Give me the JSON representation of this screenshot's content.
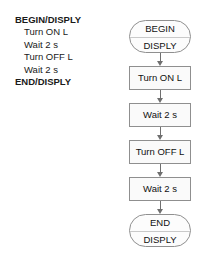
{
  "pseudocode": {
    "lines": [
      {
        "text": "BEGIN/DISPLY",
        "style": "keyword"
      },
      {
        "text": "Turn ON L",
        "style": "stmt"
      },
      {
        "text": "Wait 2 s",
        "style": "stmt"
      },
      {
        "text": "Turn OFF L",
        "style": "stmt"
      },
      {
        "text": "Wait 2 s",
        "style": "stmt"
      },
      {
        "text": "END/DISPLY",
        "style": "keyword"
      }
    ]
  },
  "flowchart": {
    "nodes": [
      {
        "type": "terminal",
        "line1": "BEGIN",
        "line2": "DISPLY"
      },
      {
        "type": "process",
        "label": "Turn ON L"
      },
      {
        "type": "process",
        "label": "Wait 2 s"
      },
      {
        "type": "process",
        "label": "Turn OFF L"
      },
      {
        "type": "process",
        "label": "Wait 2 s"
      },
      {
        "type": "terminal",
        "line1": "END",
        "line2": "DISPLY"
      }
    ]
  },
  "colors": {
    "text": "#111111",
    "node_border": "#8f8f8f",
    "node_fill": "#fafafa",
    "arrow": "#6f6f6f",
    "background": "#ffffff"
  }
}
